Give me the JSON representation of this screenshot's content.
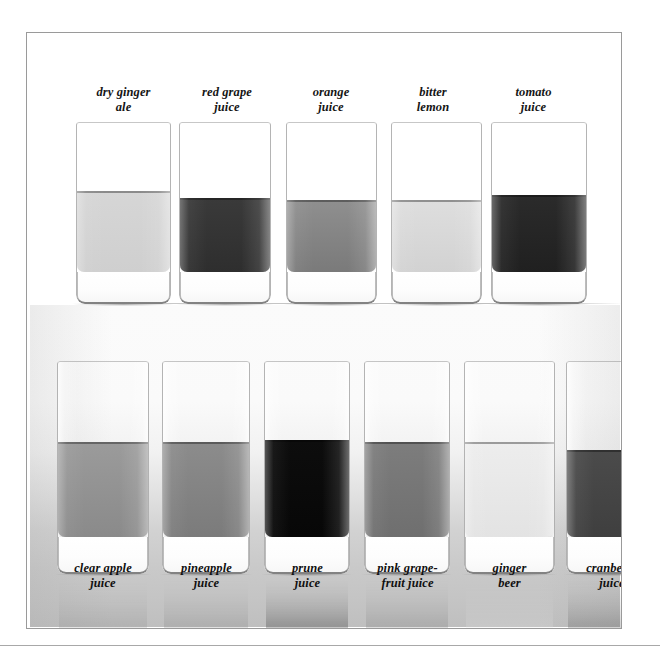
{
  "figure": {
    "kind": "photograph",
    "palette": "grayscale",
    "frame_color": "#9a9a9a",
    "top_background": "#ffffff",
    "bottom_background": "#d0d0d0"
  },
  "top_row": {
    "glasses": [
      {
        "label": "dry ginger\nale",
        "liquid_tone": "#d6d6d6",
        "liquid_tone_bottom": "#cfcfcf",
        "fill_ratio": 0.62
      },
      {
        "label": "red grape\njuice",
        "liquid_tone": "#3a3a3a",
        "liquid_tone_bottom": "#2e2e2e",
        "fill_ratio": 0.58
      },
      {
        "label": "orange\njuice",
        "liquid_tone": "#8f8f8f",
        "liquid_tone_bottom": "#7a7a7a",
        "fill_ratio": 0.57
      },
      {
        "label": "bitter\nlemon",
        "liquid_tone": "#dedede",
        "liquid_tone_bottom": "#d2d2d2",
        "fill_ratio": 0.57
      },
      {
        "label": "tomato\njuice",
        "liquid_tone": "#2b2b2b",
        "liquid_tone_bottom": "#202020",
        "fill_ratio": 0.6
      }
    ]
  },
  "bottom_row": {
    "glasses": [
      {
        "label": "clear apple\njuice",
        "liquid_tone": "#9b9b9b",
        "liquid_tone_bottom": "#8a8a8a",
        "fill_ratio": 0.62
      },
      {
        "label": "pineapple\njuice",
        "liquid_tone": "#8c8c8c",
        "liquid_tone_bottom": "#7b7b7b",
        "fill_ratio": 0.62
      },
      {
        "label": "prune\njuice",
        "liquid_tone": "#0d0d0d",
        "liquid_tone_bottom": "#070707",
        "fill_ratio": 0.63
      },
      {
        "label": "pink grape-\nfruit juice",
        "liquid_tone": "#7d7d7d",
        "liquid_tone_bottom": "#6f6f6f",
        "fill_ratio": 0.62
      },
      {
        "label": "ginger\nbeer",
        "liquid_tone": "#ededed",
        "liquid_tone_bottom": "#e3e3e3",
        "fill_ratio": 0.62
      },
      {
        "label": "cranberry\njuice",
        "liquid_tone": "#4b4b4b",
        "liquid_tone_bottom": "#3f3f3f",
        "fill_ratio": 0.58
      }
    ]
  }
}
